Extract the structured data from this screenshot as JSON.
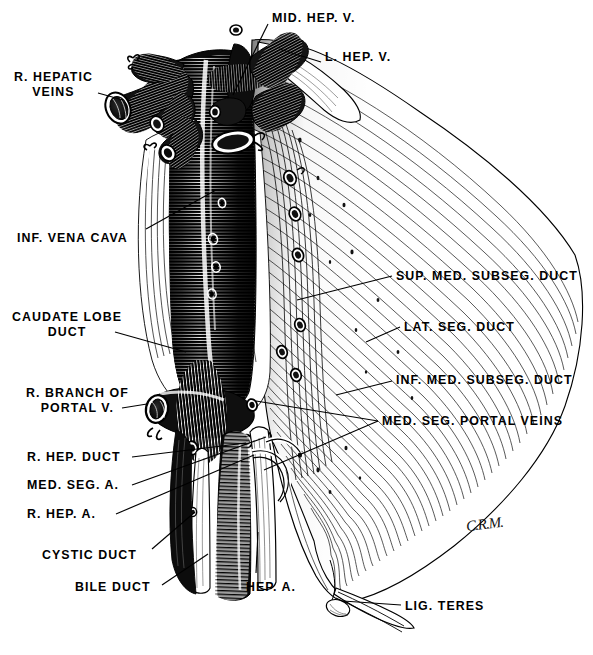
{
  "figure": {
    "kind": "anatomical-engraving",
    "signature": "C.R.M."
  },
  "palette": {
    "ink": "#000000",
    "paper": "#ffffff",
    "mid_gray": "#6a6a6a",
    "light_gray": "#b8b8b8"
  },
  "labels": [
    {
      "id": "mid-hep-v",
      "text": "MID. HEP. V.",
      "x": 272,
      "y": 11,
      "align": "left"
    },
    {
      "id": "l-hep-v",
      "text": "L. HEP. V.",
      "x": 325,
      "y": 50,
      "align": "left"
    },
    {
      "id": "r-hepatic-veins",
      "text": "R. HEPATIC\nVEINS",
      "x": 14,
      "y": 70,
      "align": "center"
    },
    {
      "id": "inf-vena-cava",
      "text": "INF. VENA CAVA",
      "x": 17,
      "y": 231,
      "align": "left"
    },
    {
      "id": "sup-med-subseg-duct",
      "text": "SUP. MED. SUBSEG. DUCT",
      "x": 396,
      "y": 269,
      "align": "left"
    },
    {
      "id": "caudate-lobe-duct",
      "text": "CAUDATE LOBE\nDUCT",
      "x": 12,
      "y": 310,
      "align": "center"
    },
    {
      "id": "lat-seg-duct",
      "text": "LAT. SEG. DUCT",
      "x": 404,
      "y": 320,
      "align": "left"
    },
    {
      "id": "inf-med-subseg-duct",
      "text": "INF. MED. SUBSEG. DUCT",
      "x": 396,
      "y": 373,
      "align": "left"
    },
    {
      "id": "r-branch-portal-v",
      "text": "R. BRANCH OF\nPORTAL V.",
      "x": 26,
      "y": 386,
      "align": "center"
    },
    {
      "id": "med-seg-portal-veins",
      "text": "MED. SEG. PORTAL VEINS",
      "x": 382,
      "y": 414,
      "align": "left"
    },
    {
      "id": "r-hep-duct",
      "text": "R. HEP. DUCT",
      "x": 27,
      "y": 450,
      "align": "left"
    },
    {
      "id": "med-seg-a",
      "text": "MED. SEG. A.",
      "x": 27,
      "y": 478,
      "align": "left"
    },
    {
      "id": "r-hep-a",
      "text": "R. HEP. A.",
      "x": 27,
      "y": 507,
      "align": "left"
    },
    {
      "id": "cystic-duct",
      "text": "CYSTIC DUCT",
      "x": 42,
      "y": 548,
      "align": "left"
    },
    {
      "id": "bile-duct",
      "text": "BILE DUCT",
      "x": 75,
      "y": 580,
      "align": "left"
    },
    {
      "id": "hep-a",
      "text": "HEP. A.",
      "x": 246,
      "y": 580,
      "align": "left"
    },
    {
      "id": "lig-teres",
      "text": "LIG. TERES",
      "x": 405,
      "y": 599,
      "align": "left"
    }
  ],
  "leaders": [
    {
      "id": "leader-mid-hep-v",
      "x1": 268,
      "y1": 24,
      "x2": 233,
      "y2": 95
    },
    {
      "id": "leader-l-hep-v",
      "x1": 321,
      "y1": 62,
      "x2": 279,
      "y2": 49
    },
    {
      "id": "leader-r-hepatic-veins",
      "x1": 98,
      "y1": 93,
      "x2": 123,
      "y2": 100
    },
    {
      "id": "leader-inf-vena-cava",
      "x1": 146,
      "y1": 229,
      "x2": 216,
      "y2": 190
    },
    {
      "id": "leader-sup-med-subseg-duct",
      "x1": 392,
      "y1": 276,
      "x2": 297,
      "y2": 300
    },
    {
      "id": "leader-caudate-lobe-duct",
      "x1": 115,
      "y1": 332,
      "x2": 186,
      "y2": 352
    },
    {
      "id": "leader-lat-seg-duct",
      "x1": 400,
      "y1": 327,
      "x2": 366,
      "y2": 342
    },
    {
      "id": "leader-inf-med-subseg-duct",
      "x1": 392,
      "y1": 381,
      "x2": 336,
      "y2": 395
    },
    {
      "id": "leader-r-branch-portal-v",
      "x1": 122,
      "y1": 408,
      "x2": 147,
      "y2": 404
    },
    {
      "id": "leader-med-seg-portal-veins",
      "x1": 378,
      "y1": 421,
      "x2": 256,
      "y2": 401
    },
    {
      "id": "leader-med-seg-portal-veins2",
      "x1": 378,
      "y1": 421,
      "x2": 264,
      "y2": 470
    },
    {
      "id": "leader-r-hep-duct",
      "x1": 132,
      "y1": 457,
      "x2": 246,
      "y2": 443
    },
    {
      "id": "leader-med-seg-a",
      "x1": 132,
      "y1": 485,
      "x2": 266,
      "y2": 437
    },
    {
      "id": "leader-r-hep-a",
      "x1": 116,
      "y1": 514,
      "x2": 254,
      "y2": 455
    },
    {
      "id": "leader-cystic-duct",
      "x1": 152,
      "y1": 549,
      "x2": 195,
      "y2": 512
    },
    {
      "id": "leader-bile-duct",
      "x1": 162,
      "y1": 585,
      "x2": 208,
      "y2": 554
    },
    {
      "id": "leader-hep-a",
      "x1": 256,
      "y1": 573,
      "x2": 258,
      "y2": 532
    },
    {
      "id": "leader-lig-teres",
      "x1": 401,
      "y1": 605,
      "x2": 343,
      "y2": 601
    }
  ],
  "structures": [
    {
      "id": "inferior-vena-cava",
      "name": "Inferior vena cava trunk"
    },
    {
      "id": "right-hepatic-veins",
      "name": "Right hepatic vein stumps"
    },
    {
      "id": "middle-hepatic-vein",
      "name": "Middle hepatic vein"
    },
    {
      "id": "left-hepatic-vein",
      "name": "Left hepatic vein"
    },
    {
      "id": "portal-vein-branch",
      "name": "Right branch of portal vein"
    },
    {
      "id": "bile-duct-trunk",
      "name": "Common bile duct"
    },
    {
      "id": "hepatic-artery",
      "name": "Hepatic artery"
    },
    {
      "id": "liver-mass",
      "name": "Liver parenchyma (hatched surface)"
    },
    {
      "id": "ligamentum-teres",
      "name": "Ligamentum teres"
    }
  ]
}
